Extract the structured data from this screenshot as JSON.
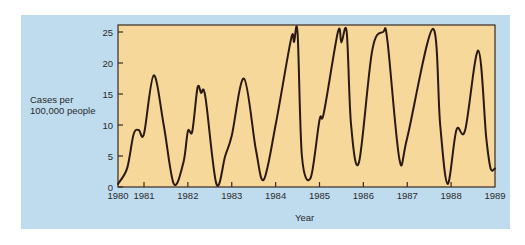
{
  "chart_data": {
    "type": "line",
    "title": "",
    "xlabel": "Year",
    "ylabel": "Cases per 100,000 people",
    "ylim": [
      0,
      25
    ],
    "xlim": [
      1980,
      1989
    ],
    "yticks": [
      0,
      5,
      10,
      15,
      20,
      25
    ],
    "xticks": [
      "1980",
      "1981",
      "1982",
      "1983",
      "1984",
      "1985",
      "1986",
      "1987",
      "1988",
      "1989"
    ],
    "grid": false,
    "legend": null,
    "colors": {
      "panel": "#bfdcef",
      "plot_area": "#f5d89a",
      "line": "#2b1a12"
    },
    "series": [
      {
        "name": "Measles cases",
        "points": [
          [
            1980.0,
            0.5
          ],
          [
            1980.35,
            3
          ],
          [
            1980.6,
            8.5
          ],
          [
            1980.8,
            9.2
          ],
          [
            1981.0,
            8.6
          ],
          [
            1981.22,
            18
          ],
          [
            1981.45,
            10
          ],
          [
            1981.68,
            0.5
          ],
          [
            1981.9,
            4
          ],
          [
            1982.0,
            9
          ],
          [
            1982.1,
            9
          ],
          [
            1982.22,
            16
          ],
          [
            1982.3,
            15.2
          ],
          [
            1982.4,
            14.5
          ],
          [
            1982.65,
            0.5
          ],
          [
            1982.85,
            5
          ],
          [
            1983.0,
            8.3
          ],
          [
            1983.28,
            17.5
          ],
          [
            1983.55,
            6
          ],
          [
            1983.73,
            1.2
          ],
          [
            1984.0,
            10
          ],
          [
            1984.35,
            23.8
          ],
          [
            1984.42,
            23.4
          ],
          [
            1984.5,
            24.8
          ],
          [
            1984.6,
            5
          ],
          [
            1984.8,
            1.5
          ],
          [
            1985.0,
            10.8
          ],
          [
            1985.1,
            12
          ],
          [
            1985.42,
            25
          ],
          [
            1985.5,
            23.3
          ],
          [
            1985.62,
            25
          ],
          [
            1985.72,
            10
          ],
          [
            1985.9,
            4
          ],
          [
            1986.2,
            22
          ],
          [
            1986.45,
            25
          ],
          [
            1986.55,
            23.5
          ],
          [
            1986.82,
            4.5
          ],
          [
            1987.0,
            8
          ],
          [
            1987.58,
            25.5
          ],
          [
            1987.75,
            10
          ],
          [
            1987.92,
            0.5
          ],
          [
            1988.12,
            9.2
          ],
          [
            1988.32,
            9.2
          ],
          [
            1988.62,
            22
          ],
          [
            1988.8,
            8
          ],
          [
            1988.9,
            3
          ],
          [
            1989.0,
            3
          ]
        ]
      }
    ]
  },
  "axes": {
    "ylabel_line1": "Cases per",
    "ylabel_line2": "100,000 people",
    "xlabel": "Year"
  }
}
